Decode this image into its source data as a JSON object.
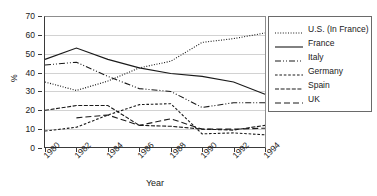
{
  "chart_data": {
    "type": "line",
    "title": "",
    "xlabel": "Year",
    "ylabel": "%",
    "x": [
      1980,
      1982,
      1984,
      1986,
      1988,
      1990,
      1992,
      1994
    ],
    "xtick_labels": [
      "1980",
      "1982",
      "1984",
      "1986",
      "1988",
      "1990",
      "1992",
      "1994"
    ],
    "ytick_labels": [
      "0",
      "10",
      "20",
      "30",
      "40",
      "50",
      "60",
      "70"
    ],
    "ylim": [
      0,
      70
    ],
    "ytick_step": 10,
    "grid": "horizontal",
    "legend_position": "right-outside",
    "series": [
      {
        "name": "U.S. (In France)",
        "line_style": "dotted",
        "color": "#1a1a1a",
        "values": [
          35,
          30.5,
          35.5,
          42.5,
          46,
          56,
          58,
          61
        ]
      },
      {
        "name": "France",
        "line_style": "solid",
        "color": "#1a1a1a",
        "values": [
          47,
          53,
          47,
          42.5,
          39.5,
          38,
          35,
          28.5
        ]
      },
      {
        "name": "Italy",
        "line_style": "dash-dot-dot",
        "color": "#1a1a1a",
        "values": [
          44,
          45.5,
          38,
          31.5,
          30,
          21.5,
          24,
          24
        ]
      },
      {
        "name": "Germany",
        "line_style": "dashed",
        "color": "#1a1a1a",
        "values": [
          9,
          11,
          17.5,
          23,
          23.5,
          7.5,
          8,
          7
        ]
      },
      {
        "name": "Spain",
        "line_style": "dash-short",
        "color": "#1a1a1a",
        "values": [
          20,
          22.5,
          22.5,
          12,
          11.5,
          10,
          9.5,
          12
        ]
      },
      {
        "name": "UK",
        "line_style": "long-dash",
        "color": "#1a1a1a",
        "values": [
          null,
          16,
          17.5,
          12,
          15.5,
          10,
          10,
          10.5
        ]
      }
    ]
  },
  "legend": {
    "items": [
      {
        "label": "U.S. (In France)"
      },
      {
        "label": "France"
      },
      {
        "label": "Italy"
      },
      {
        "label": "Germany"
      },
      {
        "label": "Spain"
      },
      {
        "label": "UK"
      }
    ]
  },
  "axes": {
    "x_title": "Year",
    "y_title": "%"
  }
}
